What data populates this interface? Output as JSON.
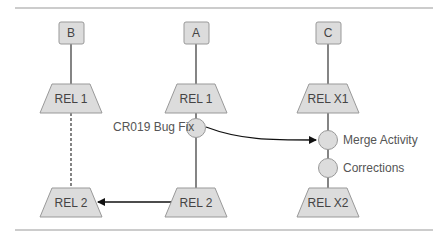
{
  "branches": [
    {
      "id": "B",
      "label": "B"
    },
    {
      "id": "A",
      "label": "A"
    },
    {
      "id": "C",
      "label": "C"
    }
  ],
  "releases": {
    "b_rel1": "REL 1",
    "b_rel2": "REL 2",
    "a_rel1": "REL 1",
    "a_rel2": "REL 2",
    "c_relx1": "REL X1",
    "c_relx2": "REL X2"
  },
  "activities": {
    "bugfix": "CR019 Bug Fix",
    "merge": "Merge Activity",
    "corrections": "Corrections"
  },
  "colors": {
    "shape_fill": "#dcdcdc",
    "shape_stroke": "#999999",
    "line": "#222222",
    "rule": "#999999"
  }
}
